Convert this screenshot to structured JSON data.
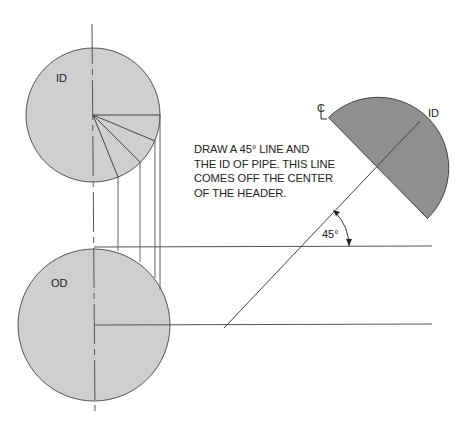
{
  "diagram": {
    "colors": {
      "id_circle_fill": "#cfcfcf",
      "od_circle_fill": "#cfcfcf",
      "header_half_fill": "#8f8f8f",
      "line": "#444444"
    },
    "labels": {
      "id_circle": "ID",
      "od_circle": "OD",
      "centerline_symbol": "CL",
      "half_circle_id": "ID",
      "angle": "45°"
    },
    "note_lines": [
      "DRAW A 45° LINE AND",
      "THE ID OF PIPE. THIS LINE",
      "COMES OFF THE CENTER",
      "OF THE HEADER."
    ],
    "shapes": {
      "id_circle": {
        "cx": 93,
        "cy": 115,
        "r": 67
      },
      "od_circle": {
        "cx": 94,
        "cy": 325,
        "r": 76
      },
      "header_half": {
        "cx": 378,
        "cy": 168,
        "r": 70,
        "diameter_angle_deg": 45
      },
      "radial_divisions_deg": [
        0,
        22.5,
        45,
        67.5
      ],
      "projection_lines_x": [
        118,
        141,
        156,
        161
      ],
      "horizontal_lines_y": [
        247,
        325
      ],
      "angle_line": {
        "from": [
          224,
          328
        ],
        "to": [
          378,
          168
        ],
        "angle_deg": 45
      }
    }
  }
}
